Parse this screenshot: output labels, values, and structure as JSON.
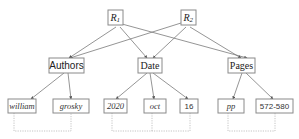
{
  "diagram": {
    "roots": [
      {
        "id": "r1",
        "label_main": "R",
        "label_sub": "1"
      },
      {
        "id": "r2",
        "label_main": "R",
        "label_sub": "2"
      }
    ],
    "fields": [
      {
        "id": "authors",
        "label": "Authors"
      },
      {
        "id": "date",
        "label": "Date"
      },
      {
        "id": "pages",
        "label": "Pages"
      }
    ],
    "leaves": [
      {
        "id": "william",
        "label": "william",
        "parent": "authors"
      },
      {
        "id": "grosky",
        "label": "grosky",
        "parent": "authors"
      },
      {
        "id": "year",
        "label": "2020",
        "parent": "date"
      },
      {
        "id": "month",
        "label": "oct",
        "parent": "date"
      },
      {
        "id": "day",
        "label": "16",
        "parent": "date"
      },
      {
        "id": "pp",
        "label": "pp",
        "parent": "pages"
      },
      {
        "id": "range",
        "label": "572-580",
        "parent": "pages"
      }
    ],
    "edges": [
      [
        "r1",
        "authors"
      ],
      [
        "r1",
        "date"
      ],
      [
        "r1",
        "pages"
      ],
      [
        "r2",
        "authors"
      ],
      [
        "r2",
        "date"
      ],
      [
        "r2",
        "pages"
      ],
      [
        "authors",
        "william"
      ],
      [
        "authors",
        "grosky"
      ],
      [
        "date",
        "year"
      ],
      [
        "date",
        "month"
      ],
      [
        "date",
        "day"
      ],
      [
        "pages",
        "pp"
      ],
      [
        "pages",
        "range"
      ]
    ],
    "colors": {
      "stroke": "#8a8a8a",
      "edge": "#7a7a7a",
      "dotted": "#b5b5b5",
      "text": "#222222"
    }
  }
}
